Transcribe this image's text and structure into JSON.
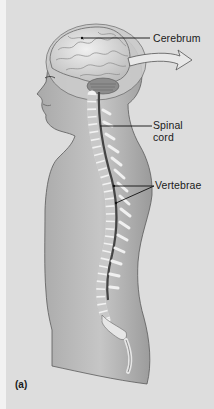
{
  "figure": {
    "panel_label": "(a)",
    "labels": {
      "cerebrum": "Cerebrum",
      "spinal_cord_line1": "Spinal",
      "spinal_cord_line2": "cord",
      "vertebrae": "Vertebrae"
    },
    "colors": {
      "background": "#dddddd",
      "body_fill": "#b9b9b9",
      "body_outline": "#5a5a5a",
      "brain_fill": "#e4e4e4",
      "bone_fill": "#ededed",
      "text": "#1a1a1a"
    }
  }
}
